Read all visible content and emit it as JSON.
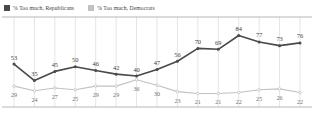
{
  "legend": {
    "entries": [
      {
        "label": "% Too much, Republicans",
        "color": "#4a4a4a",
        "icon": "square-swatch-dark"
      },
      {
        "label": "% Too much, Democrats",
        "color": "#c2c2c2",
        "icon": "square-swatch-light"
      }
    ]
  },
  "chart_data": {
    "type": "line",
    "title": "",
    "subtitle": "",
    "xlabel": "",
    "ylabel": "",
    "ylim": [
      15,
      90
    ],
    "grid": "vertical",
    "legend_position": "top-left",
    "categories": [
      "1",
      "2",
      "3",
      "4",
      "5",
      "6",
      "7",
      "8",
      "9",
      "10",
      "11",
      "12",
      "13",
      "14",
      "15"
    ],
    "series": [
      {
        "name": "% Too much, Republicans",
        "color": "#4a4a4a",
        "values": [
          53,
          35,
          45,
          50,
          46,
          42,
          40,
          47,
          56,
          70,
          69,
          84,
          77,
          73,
          76
        ]
      },
      {
        "name": "% Too much, Democrats",
        "color": "#c2c2c2",
        "values": [
          29,
          24,
          27,
          25,
          29,
          29,
          36,
          30,
          23,
          21,
          21,
          22,
          25,
          26,
          22
        ]
      }
    ]
  }
}
